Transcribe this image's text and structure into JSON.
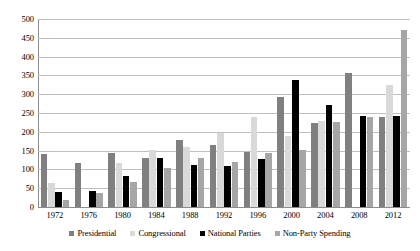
{
  "chart_data": {
    "type": "bar",
    "title": "",
    "subtitle": "",
    "xlabel": "",
    "ylabel": "",
    "ylim": [
      0,
      500
    ],
    "ytick_step": 50,
    "yticks": [
      0,
      50,
      100,
      150,
      200,
      250,
      300,
      350,
      400,
      450,
      500
    ],
    "grid": true,
    "legend_position": "bottom",
    "categories": [
      "1972",
      "1976",
      "1980",
      "1984",
      "1988",
      "1992",
      "1996",
      "2000",
      "2004",
      "2008",
      "2012"
    ],
    "series": [
      {
        "name": "Presidential",
        "color": "#808080",
        "values": [
          140,
          118,
          143,
          131,
          178,
          166,
          147,
          292,
          224,
          357,
          240
        ]
      },
      {
        "name": "Congressional",
        "color": "#d9d9d9",
        "values": [
          63,
          0,
          117,
          152,
          160,
          197,
          240,
          190,
          230,
          0,
          324
        ]
      },
      {
        "name": "National Parties",
        "color": "#000000",
        "values": [
          41,
          42,
          83,
          131,
          113,
          108,
          128,
          338,
          272,
          243,
          242
        ]
      },
      {
        "name": "Non-Party Spending",
        "color": "#a6a6a6",
        "values": [
          18,
          38,
          67,
          104,
          131,
          119,
          143,
          152,
          226,
          240,
          470
        ]
      }
    ]
  },
  "axes": {
    "y_tick_labels": [
      "500",
      "450",
      "400",
      "350",
      "300",
      "250",
      "200",
      "150",
      "100",
      "50",
      "0"
    ],
    "x_tick_labels": [
      "1972",
      "1976",
      "1980",
      "1984",
      "1988",
      "1992",
      "1996",
      "2000",
      "2004",
      "2008",
      "2012"
    ]
  },
  "legend": {
    "items": [
      {
        "label": "Presidential"
      },
      {
        "label": "Congressional"
      },
      {
        "label": "National Parties"
      },
      {
        "label": "Non-Party Spending"
      }
    ]
  },
  "colors": {
    "presidential": "#808080",
    "congressional": "#d9d9d9",
    "national_parties": "#000000",
    "non_party_spending": "#a6a6a6",
    "gridline": "#bfbfbf",
    "axis": "#8c8c8c",
    "background": "#ffffff"
  }
}
